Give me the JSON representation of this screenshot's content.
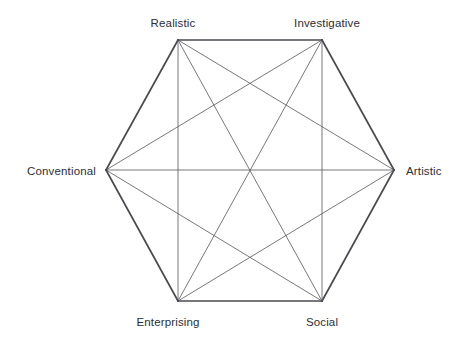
{
  "chart_data": {
    "type": "diagram",
    "title": "",
    "subtitle": "",
    "shape": "hexagon",
    "xlabel": "",
    "ylabel": "",
    "grid": false,
    "legend": null,
    "vertices": [
      {
        "id": "realistic",
        "label": "Realistic",
        "position": "top-left",
        "point_x": 178,
        "point_y": 40,
        "label_x": 173,
        "label_y": 23,
        "anchor": "center"
      },
      {
        "id": "investigative",
        "label": "Investigative",
        "position": "top-right",
        "point_x": 322,
        "point_y": 40,
        "label_x": 327,
        "label_y": 23,
        "anchor": "center"
      },
      {
        "id": "artistic",
        "label": "Artistic",
        "position": "right",
        "point_x": 394,
        "point_y": 170,
        "label_x": 406,
        "label_y": 171,
        "anchor": "left"
      },
      {
        "id": "social",
        "label": "Social",
        "position": "bottom-right",
        "point_x": 322,
        "point_y": 301,
        "label_x": 322,
        "label_y": 322,
        "anchor": "center"
      },
      {
        "id": "enterprising",
        "label": "Enterprising",
        "position": "bottom-left",
        "point_x": 178,
        "point_y": 301,
        "label_x": 168,
        "label_y": 322,
        "anchor": "center"
      },
      {
        "id": "conventional",
        "label": "Conventional",
        "position": "left",
        "point_x": 106,
        "point_y": 170,
        "label_x": 96,
        "label_y": 171,
        "anchor": "right"
      }
    ],
    "edges": [
      {
        "from": "realistic",
        "to": "investigative",
        "kind": "perimeter"
      },
      {
        "from": "investigative",
        "to": "artistic",
        "kind": "perimeter"
      },
      {
        "from": "artistic",
        "to": "social",
        "kind": "perimeter"
      },
      {
        "from": "social",
        "to": "enterprising",
        "kind": "perimeter"
      },
      {
        "from": "enterprising",
        "to": "conventional",
        "kind": "perimeter"
      },
      {
        "from": "conventional",
        "to": "realistic",
        "kind": "perimeter"
      },
      {
        "from": "realistic",
        "to": "artistic",
        "kind": "chord"
      },
      {
        "from": "realistic",
        "to": "social",
        "kind": "diagonal"
      },
      {
        "from": "realistic",
        "to": "enterprising",
        "kind": "chord"
      },
      {
        "from": "investigative",
        "to": "social",
        "kind": "chord"
      },
      {
        "from": "investigative",
        "to": "enterprising",
        "kind": "diagonal"
      },
      {
        "from": "investigative",
        "to": "conventional",
        "kind": "chord"
      },
      {
        "from": "artistic",
        "to": "enterprising",
        "kind": "chord"
      },
      {
        "from": "artistic",
        "to": "conventional",
        "kind": "diagonal"
      },
      {
        "from": "social",
        "to": "conventional",
        "kind": "chord"
      }
    ],
    "colors": {
      "background": "#ffffff",
      "perimeter_stroke": "#4a4a50",
      "interior_stroke": "#55555c",
      "label_text": "#2e2e33"
    },
    "stroke_widths": {
      "perimeter": 1.7,
      "interior": 0.8
    }
  }
}
